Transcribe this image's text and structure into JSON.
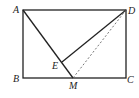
{
  "diagram": {
    "type": "geometry",
    "points": {
      "A": {
        "label": "A",
        "x": 23,
        "y": 10
      },
      "B": {
        "label": "B",
        "x": 23,
        "y": 78
      },
      "C": {
        "label": "C",
        "x": 126,
        "y": 78
      },
      "D": {
        "label": "D",
        "x": 126,
        "y": 10
      },
      "M": {
        "label": "M",
        "x": 73,
        "y": 78
      },
      "E": {
        "label": "E",
        "x": 62,
        "y": 62
      }
    },
    "segments": [
      {
        "from": "A",
        "to": "D",
        "style": "solid"
      },
      {
        "from": "D",
        "to": "C",
        "style": "solid"
      },
      {
        "from": "C",
        "to": "B",
        "style": "solid"
      },
      {
        "from": "B",
        "to": "A",
        "style": "solid"
      },
      {
        "from": "A",
        "to": "M",
        "style": "solid"
      },
      {
        "from": "E",
        "to": "D",
        "style": "solid"
      },
      {
        "from": "D",
        "to": "M",
        "style": "dashed"
      }
    ],
    "colors": {
      "line": "#222222",
      "background": "#ffffff"
    }
  }
}
